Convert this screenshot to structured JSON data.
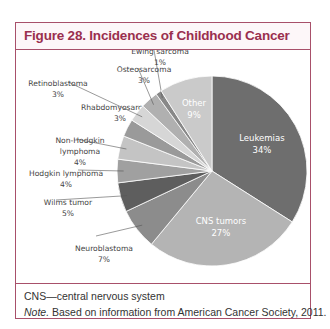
{
  "figure": {
    "title": "Figure 28. Incidences of Childhood Cancer",
    "footnote_abbrev": "CNS—central nervous system",
    "note_label": "Note.",
    "note_text": " Based on information from American Cancer Society, 2011."
  },
  "colors": {
    "frame": "#a8506a",
    "title": "#9a2f4e"
  },
  "chart_data": {
    "type": "pie",
    "title": "Figure 28. Incidences of Childhood Cancer",
    "start_angle_deg": 0,
    "direction": "clockwise",
    "unit": "%",
    "categories": [
      "Leukemias",
      "CNS tumors",
      "Neuroblastoma",
      "Wilms tumor",
      "Hodgkin lymphoma",
      "Non-Hodgkin lymphoma",
      "Rhabdomyosarcoma",
      "Retinoblastoma",
      "Osteosarcoma",
      "Ewing sarcoma",
      "Other"
    ],
    "values": [
      34,
      27,
      7,
      5,
      4,
      4,
      3,
      3,
      3,
      1,
      9
    ],
    "slice_colors": [
      "#6e6e6e",
      "#b4b4b4",
      "#8c8c8c",
      "#5e5e5e",
      "#a0a0a0",
      "#c4c4c4",
      "#9a9a9a",
      "#d6d6d6",
      "#b0b0b0",
      "#888888",
      "#cacaca"
    ],
    "labels": [
      {
        "lines": [
          "Leukemias",
          "34%"
        ],
        "inside": true
      },
      {
        "lines": [
          "CNS tumors",
          "27%"
        ],
        "inside": true
      },
      {
        "lines": [
          "Neuroblastoma",
          "7%"
        ],
        "inside": false
      },
      {
        "lines": [
          "Wilms tumor",
          "5%"
        ],
        "inside": false
      },
      {
        "lines": [
          "Hodgkin lymphoma",
          "4%"
        ],
        "inside": false
      },
      {
        "lines": [
          "Non-Hodgkin",
          "lymphoma",
          "4%"
        ],
        "inside": false
      },
      {
        "lines": [
          "Rhabdomyosarcoma",
          "3%"
        ],
        "inside": false
      },
      {
        "lines": [
          "Retinoblastoma",
          "3%"
        ],
        "inside": false
      },
      {
        "lines": [
          "Osteosarcoma",
          "3%"
        ],
        "inside": false
      },
      {
        "lines": [
          "Ewing sarcoma",
          "1%"
        ],
        "inside": false
      },
      {
        "lines": [
          "Other",
          "9%"
        ],
        "inside": true
      }
    ],
    "legend": "none (data labels with leader lines)"
  }
}
